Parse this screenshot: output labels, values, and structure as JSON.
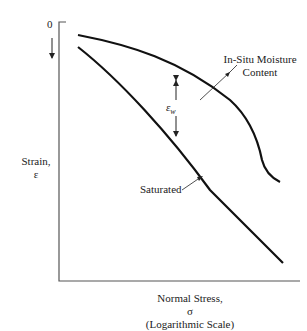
{
  "diagram": {
    "title": "",
    "y_axis": {
      "origin_label": "0",
      "label_line1": "Strain,",
      "label_line2": "ε",
      "direction": "downward (increasing strain)"
    },
    "x_axis": {
      "label_line1": "Normal Stress,",
      "label_line2": "σ",
      "label_line3": "(Logarithmic Scale)"
    },
    "curves": [
      {
        "name": "In-Situ Moisture Content",
        "label_line1": "In-Situ Moisture",
        "label_line2": "Content"
      },
      {
        "name": "Saturated",
        "label": "Saturated"
      }
    ],
    "annotation": {
      "symbol": "ε",
      "subscript": "w",
      "meaning": "strain difference between curves"
    },
    "colors": {
      "line": "#111111",
      "axis": "#555555",
      "text": "#222222"
    }
  }
}
